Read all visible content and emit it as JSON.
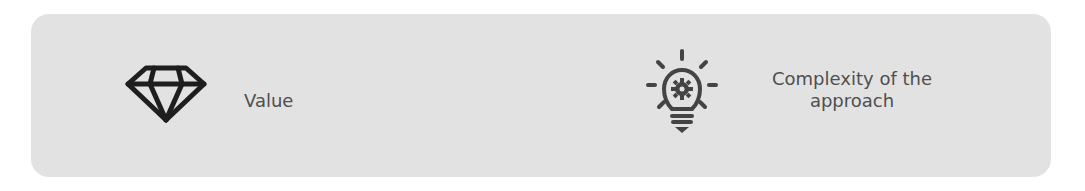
{
  "items": [
    {
      "icon": "diamond-icon",
      "label": "Value"
    },
    {
      "icon": "lightbulb-gear-icon",
      "label_lines": [
        "Complexity of the",
        "approach"
      ]
    }
  ],
  "colors": {
    "card_background": "#e2e2e2",
    "text": "#4f4f4f",
    "diamond_icon": "#1e1e1e",
    "lightbulb_icon": "#444444"
  }
}
